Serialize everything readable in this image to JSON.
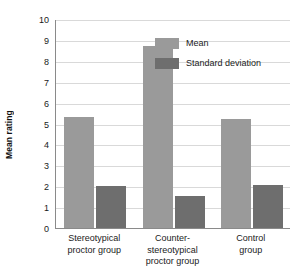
{
  "chart_data": {
    "type": "bar",
    "title": "",
    "xlabel": "",
    "ylabel": "Mean rating",
    "ylim": [
      0,
      10
    ],
    "ytick_labels": [
      "10",
      "9",
      "8",
      "7",
      "6",
      "5",
      "4",
      "3",
      "2",
      "1",
      "0"
    ],
    "yticks": [
      10,
      9,
      8,
      7,
      6,
      5,
      4,
      3,
      2,
      1,
      0
    ],
    "grid": true,
    "legend_position": "top-right-inside",
    "categories": [
      "Stereotypical proctor group",
      "Counter-stereotypical proctor group",
      "Control group"
    ],
    "category_label_lines": [
      [
        "Stereotypical",
        "proctor group"
      ],
      [
        "Counter-",
        "stereotypical",
        "proctor group"
      ],
      [
        "Control",
        "group"
      ]
    ],
    "series": [
      {
        "name": "Mean",
        "color": "#9a9a9a",
        "values": [
          5.3,
          8.7,
          5.2
        ]
      },
      {
        "name": "Standard deviation",
        "color": "#6e6e6e",
        "values": [
          2.0,
          1.55,
          2.05
        ]
      }
    ]
  },
  "legend": {
    "items": [
      {
        "label": "Mean",
        "color": "#9a9a9a"
      },
      {
        "label": "Standard deviation",
        "color": "#6e6e6e"
      }
    ]
  },
  "axes": {
    "y_title": "Mean rating"
  },
  "colors": {
    "mean": "#9a9a9a",
    "sd": "#6e6e6e",
    "grid": "#d9d9d9",
    "axis": "#8a8a8a",
    "background": "#ffffff"
  }
}
